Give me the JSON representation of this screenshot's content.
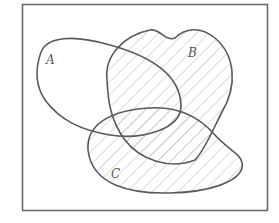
{
  "diagram": {
    "type": "venn",
    "sets": [
      {
        "id": "A",
        "label": "A",
        "shaded": false
      },
      {
        "id": "B",
        "label": "B",
        "shaded": true
      },
      {
        "id": "C",
        "label": "C",
        "shaded": true
      }
    ],
    "shaded_region": "B ∪ C",
    "colors": {
      "outline": "#5a5a5a",
      "frame": "#6a6a6a",
      "hatch": "#bdbdbd",
      "background": "#ffffff"
    }
  }
}
